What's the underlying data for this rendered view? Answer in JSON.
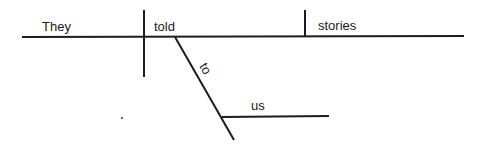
{
  "diagram": {
    "type": "sentence-diagram",
    "sentence": "They told stories to us",
    "words": {
      "subject": "They",
      "verb": "told",
      "direct_object": "stories",
      "preposition": "to",
      "prep_object": "us"
    },
    "colors": {
      "line": "#1c1c1c",
      "text": "#1a1a1a",
      "background": "#ffffff"
    }
  }
}
